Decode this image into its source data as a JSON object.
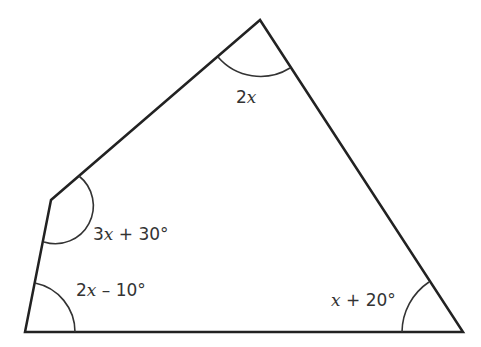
{
  "diagram": {
    "type": "pentagon-angles",
    "stroke_color": "#222222",
    "vertices": [
      {
        "id": "top",
        "x": 260,
        "y": 20
      },
      {
        "id": "upper-left",
        "x": 51,
        "y": 200
      },
      {
        "id": "bottom-left",
        "x": 25,
        "y": 332
      },
      {
        "id": "bottom-right",
        "x": 463,
        "y": 332
      }
    ],
    "angles": {
      "top": {
        "coef": "2",
        "var": "x",
        "rest": ""
      },
      "upper_left": {
        "coef": "3",
        "var": "x",
        "rest": " + 30°"
      },
      "bottom_left": {
        "coef": "2",
        "var": "x",
        "rest": " – 10°"
      },
      "bottom_right": {
        "coef": "",
        "var": "x",
        "rest": " + 20°"
      }
    }
  }
}
